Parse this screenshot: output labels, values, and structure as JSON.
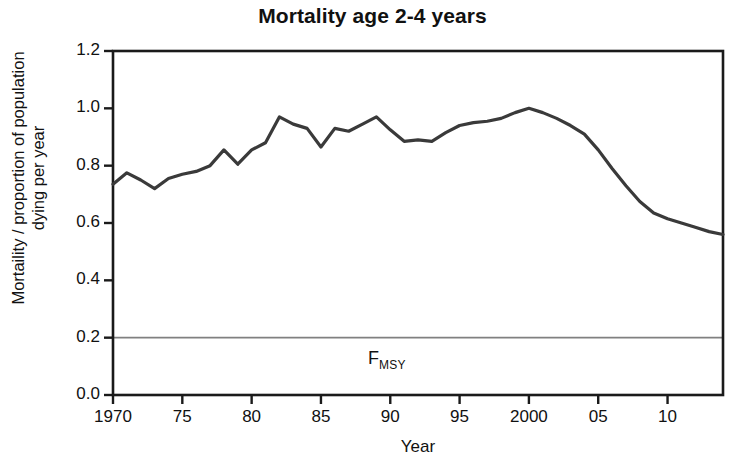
{
  "chart_data": {
    "type": "line",
    "title": "Mortality age 2-4 years",
    "xlabel": "Year",
    "ylabel": "Mortaility / proportion of population\ndying per year",
    "xlim": [
      1970,
      2014
    ],
    "ylim": [
      0.0,
      1.2
    ],
    "grid": false,
    "legend": null,
    "x_tick_labels": [
      "1970",
      "75",
      "80",
      "85",
      "90",
      "95",
      "2000",
      "05",
      "10"
    ],
    "x_tick_values": [
      1970,
      1975,
      1980,
      1985,
      1990,
      1995,
      2000,
      2005,
      2010
    ],
    "y_tick_labels": [
      "0.0",
      "0.2",
      "0.4",
      "0.6",
      "0.8",
      "1.0",
      "1.2"
    ],
    "y_tick_values": [
      0.0,
      0.2,
      0.4,
      0.6,
      0.8,
      1.0,
      1.2
    ],
    "line_color": "#3a3a3a",
    "reference_line_color": "#808080",
    "annotations": [
      {
        "name": "fmsy",
        "text": "F",
        "subscript": "MSY",
        "y_value": 0.2,
        "note": "horizontal reference line at 0.2 labelled F MSY"
      }
    ],
    "x": [
      1970,
      1971,
      1972,
      1973,
      1974,
      1975,
      1976,
      1977,
      1978,
      1979,
      1980,
      1981,
      1982,
      1983,
      1984,
      1985,
      1986,
      1987,
      1988,
      1989,
      1990,
      1991,
      1992,
      1993,
      1994,
      1995,
      1996,
      1997,
      1998,
      1999,
      2000,
      2001,
      2002,
      2003,
      2004,
      2005,
      2006,
      2007,
      2008,
      2009,
      2010,
      2011,
      2012,
      2013,
      2014
    ],
    "values": [
      0.735,
      0.775,
      0.75,
      0.72,
      0.755,
      0.77,
      0.78,
      0.8,
      0.855,
      0.805,
      0.855,
      0.88,
      0.97,
      0.945,
      0.93,
      0.865,
      0.93,
      0.92,
      0.945,
      0.97,
      0.925,
      0.885,
      0.89,
      0.885,
      0.915,
      0.94,
      0.95,
      0.955,
      0.965,
      0.985,
      1.0,
      0.985,
      0.965,
      0.94,
      0.91,
      0.855,
      0.79,
      0.73,
      0.675,
      0.635,
      0.615,
      0.6,
      0.585,
      0.57,
      0.56
    ]
  }
}
